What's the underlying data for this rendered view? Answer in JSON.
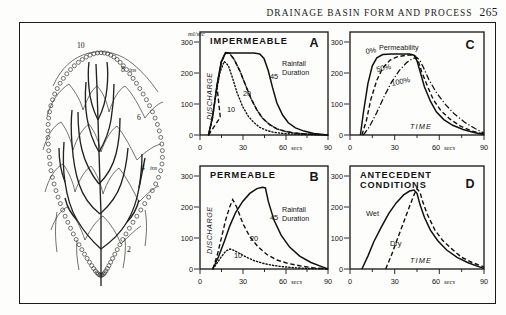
{
  "running_head": {
    "title": "DRAINAGE BASIN FORM AND PROCESS",
    "page_number": "265"
  },
  "basin_map": {
    "name": "drainage-basin-isohyet-map",
    "isohyet_labels": [
      {
        "text": "10",
        "x": 62,
        "y": 20
      },
      {
        "text": "8",
        "x": 104,
        "y": 44
      },
      {
        "text": "ins",
        "x": 112,
        "y": 44
      },
      {
        "text": "6",
        "x": 118,
        "y": 92
      },
      {
        "text": "4",
        "x": 122,
        "y": 142
      },
      {
        "text": "ins",
        "x": 130,
        "y": 142
      },
      {
        "text": "2",
        "x": 108,
        "y": 222
      }
    ]
  },
  "chart_data": [
    {
      "id": "A",
      "type": "line",
      "title": "IMPERMEABLE",
      "panel_letter": "A",
      "xlabel": "",
      "ylabel": "DISCHARGE",
      "yunits": "ml/sec",
      "xunits": "secs",
      "xlim": [
        0,
        90
      ],
      "ylim": [
        0,
        320
      ],
      "xticks": [
        0,
        30,
        60,
        90
      ],
      "xticklabels": [
        "0",
        "30",
        "60",
        "90"
      ],
      "yticks": [
        0,
        100,
        200,
        300
      ],
      "yticklabels": [
        "0",
        "100",
        "200",
        "300"
      ],
      "annotation": "Rainfall Duration",
      "series": [
        {
          "name": "10",
          "label": "10",
          "style": "dotted",
          "x": [
            6,
            8,
            11,
            14,
            17,
            20,
            23,
            26,
            30,
            34,
            38,
            42,
            47,
            52,
            58,
            64,
            70,
            78,
            90
          ],
          "y": [
            0,
            40,
            120,
            195,
            228,
            215,
            175,
            130,
            88,
            58,
            38,
            24,
            14,
            8,
            5,
            3,
            2,
            1,
            0
          ]
        },
        {
          "name": "20",
          "label": "20",
          "style": "dashed",
          "x": [
            6,
            9,
            12,
            15,
            18,
            21,
            24,
            28,
            32,
            36,
            40,
            44,
            49,
            54,
            60,
            66,
            72,
            80,
            90
          ],
          "y": [
            0,
            55,
            150,
            225,
            255,
            252,
            235,
            200,
            155,
            112,
            78,
            52,
            32,
            19,
            11,
            6,
            4,
            2,
            0
          ]
        },
        {
          "name": "45",
          "label": "45",
          "style": "solid",
          "x": [
            6,
            9,
            12,
            15,
            18,
            21,
            26,
            32,
            38,
            42,
            45,
            48,
            51,
            54,
            58,
            62,
            67,
            73,
            80,
            90
          ],
          "y": [
            0,
            58,
            155,
            228,
            256,
            255,
            255,
            255,
            255,
            252,
            238,
            200,
            148,
            100,
            62,
            38,
            22,
            12,
            5,
            0
          ]
        }
      ]
    },
    {
      "id": "B",
      "type": "line",
      "title": "PERMEABLE",
      "panel_letter": "B",
      "xlabel": "",
      "ylabel": "DISCHARGE",
      "yunits": "",
      "xunits": "secs",
      "xlim": [
        0,
        90
      ],
      "ylim": [
        0,
        320
      ],
      "xticks": [
        0,
        30,
        60,
        90
      ],
      "xticklabels": [
        "0",
        "30",
        "60",
        "90"
      ],
      "yticks": [
        0,
        100,
        200,
        300
      ],
      "yticklabels": [
        "0",
        "100",
        "200",
        "300"
      ],
      "annotation": "Rainfall Duration",
      "series": [
        {
          "name": "10",
          "label": "10",
          "style": "dotted",
          "x": [
            9,
            12,
            15,
            18,
            21,
            24,
            28,
            33,
            38,
            44,
            50,
            58,
            66,
            75,
            84,
            90
          ],
          "y": [
            0,
            18,
            38,
            55,
            62,
            58,
            48,
            36,
            26,
            18,
            12,
            7,
            4,
            2,
            1,
            0
          ]
        },
        {
          "name": "20",
          "label": "20",
          "style": "dashed",
          "x": [
            9,
            12,
            15,
            18,
            21,
            23,
            26,
            30,
            35,
            41,
            47,
            54,
            62,
            70,
            79,
            90
          ],
          "y": [
            0,
            40,
            95,
            150,
            195,
            215,
            190,
            142,
            100,
            68,
            45,
            28,
            17,
            10,
            4,
            0
          ]
        },
        {
          "name": "45",
          "label": "45",
          "style": "solid",
          "x": [
            9,
            13,
            17,
            21,
            25,
            30,
            35,
            40,
            44,
            46,
            48,
            52,
            57,
            63,
            70,
            78,
            85,
            90
          ],
          "y": [
            0,
            38,
            85,
            135,
            175,
            210,
            235,
            250,
            254,
            252,
            210,
            152,
            105,
            68,
            40,
            20,
            8,
            0
          ]
        }
      ]
    },
    {
      "id": "C",
      "type": "line",
      "title": "",
      "panel_letter": "C",
      "xlabel": "TIME",
      "ylabel": "",
      "yunits": "",
      "xunits": "secs",
      "xlim": [
        0,
        90
      ],
      "ylim": [
        0,
        320
      ],
      "xticks": [
        0,
        30,
        60,
        90
      ],
      "xticklabels": [
        "0",
        "30",
        "60",
        "90"
      ],
      "yticks": [
        0,
        100,
        200,
        300
      ],
      "yticklabels": [
        "0",
        "100",
        "200",
        "300"
      ],
      "legend_note": "Permeability",
      "series": [
        {
          "name": "0%",
          "label": "0%",
          "style": "solid",
          "x": [
            7,
            9,
            12,
            15,
            18,
            22,
            28,
            34,
            40,
            43,
            45,
            47,
            50,
            54,
            58,
            63,
            69,
            76,
            84,
            90
          ],
          "y": [
            0,
            70,
            160,
            215,
            240,
            250,
            252,
            252,
            252,
            248,
            230,
            198,
            150,
            105,
            72,
            48,
            30,
            17,
            7,
            2
          ]
        },
        {
          "name": "50%",
          "label": "50%",
          "style": "dashed",
          "x": [
            8,
            11,
            14,
            18,
            22,
            27,
            32,
            37,
            41,
            44,
            46,
            48,
            52,
            56,
            61,
            67,
            74,
            82,
            90
          ],
          "y": [
            0,
            45,
            110,
            170,
            208,
            230,
            240,
            244,
            245,
            242,
            228,
            198,
            152,
            110,
            76,
            50,
            28,
            12,
            3
          ]
        },
        {
          "name": "100%",
          "label": "100%",
          "style": "dashdot",
          "x": [
            9,
            13,
            18,
            23,
            28,
            33,
            38,
            42,
            45,
            47,
            49,
            53,
            58,
            64,
            70,
            77,
            84,
            90
          ],
          "y": [
            0,
            25,
            70,
            120,
            165,
            200,
            225,
            238,
            240,
            232,
            212,
            172,
            132,
            96,
            66,
            40,
            20,
            6
          ]
        }
      ]
    },
    {
      "id": "D",
      "type": "line",
      "title": "ANTECEDENT CONDITIONS",
      "title_line1": "ANTECEDENT",
      "title_line2": "CONDITIONS",
      "panel_letter": "D",
      "xlabel": "TIME",
      "ylabel": "",
      "yunits": "",
      "xunits": "secs",
      "xlim": [
        0,
        90
      ],
      "ylim": [
        0,
        320
      ],
      "xticks": [
        0,
        30,
        60,
        90
      ],
      "xticklabels": [
        "0",
        "30",
        "60",
        "90"
      ],
      "yticks": [
        0,
        100,
        200,
        300
      ],
      "yticklabels": [
        "0",
        "100",
        "200",
        "300"
      ],
      "series": [
        {
          "name": "Wet",
          "label": "Wet",
          "style": "solid",
          "x": [
            8,
            12,
            16,
            21,
            26,
            31,
            36,
            40,
            43,
            45,
            47,
            50,
            54,
            59,
            65,
            72,
            79,
            86,
            90
          ],
          "y": [
            0,
            40,
            85,
            130,
            172,
            205,
            230,
            242,
            245,
            235,
            200,
            160,
            118,
            85,
            58,
            36,
            20,
            8,
            2
          ]
        },
        {
          "name": "Dry",
          "label": "Dry",
          "style": "dashed",
          "x": [
            24,
            28,
            32,
            36,
            40,
            43,
            45,
            47,
            49,
            52,
            57,
            62,
            68,
            75,
            82,
            88,
            90
          ],
          "y": [
            0,
            45,
            95,
            145,
            195,
            230,
            250,
            238,
            205,
            168,
            122,
            90,
            64,
            42,
            26,
            16,
            12
          ]
        }
      ]
    }
  ]
}
